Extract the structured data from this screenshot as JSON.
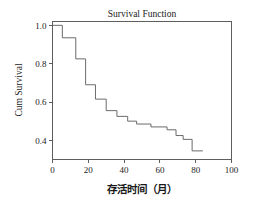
{
  "chart_data": {
    "type": "line",
    "subtype": "kaplan-meier-step",
    "title": "Survival Function",
    "xlabel": "存活时间（月）",
    "ylabel": "Cum Survival",
    "xlim": [
      0,
      100
    ],
    "ylim": [
      0.3,
      1.02
    ],
    "grid": false,
    "legend": null,
    "x_ticks": [
      0,
      20,
      40,
      60,
      80,
      100
    ],
    "x_tick_labels": [
      "0",
      "20",
      "40",
      "60",
      "80",
      "100"
    ],
    "y_ticks": [
      0.4,
      0.6,
      0.8,
      1.0
    ],
    "y_tick_labels": [
      "0.4",
      "0.6",
      "0.8",
      "1.0"
    ],
    "series": [
      {
        "name": "Cum Survival",
        "color": "#6b6b6b",
        "x": [
          0,
          5.5,
          5.5,
          13,
          13,
          18.5,
          18.5,
          24,
          24,
          30,
          30,
          36,
          36,
          42,
          42,
          47,
          47,
          55,
          55,
          64,
          64,
          69,
          69,
          73,
          73,
          78,
          78,
          84
        ],
        "y": [
          1.0,
          1.0,
          0.935,
          0.935,
          0.825,
          0.825,
          0.69,
          0.69,
          0.615,
          0.615,
          0.555,
          0.555,
          0.525,
          0.525,
          0.5,
          0.5,
          0.485,
          0.485,
          0.47,
          0.47,
          0.455,
          0.455,
          0.425,
          0.425,
          0.405,
          0.405,
          0.345,
          0.345
        ]
      }
    ],
    "steps": [
      {
        "time": 0,
        "survival": 1.0
      },
      {
        "time": 5.5,
        "survival": 0.935
      },
      {
        "time": 13,
        "survival": 0.825
      },
      {
        "time": 18.5,
        "survival": 0.69
      },
      {
        "time": 24,
        "survival": 0.615
      },
      {
        "time": 30,
        "survival": 0.555
      },
      {
        "time": 36,
        "survival": 0.525
      },
      {
        "time": 42,
        "survival": 0.5
      },
      {
        "time": 47,
        "survival": 0.485
      },
      {
        "time": 55,
        "survival": 0.47
      },
      {
        "time": 64,
        "survival": 0.455
      },
      {
        "time": 69,
        "survival": 0.425
      },
      {
        "time": 73,
        "survival": 0.405
      },
      {
        "time": 78,
        "survival": 0.345
      },
      {
        "time": 84,
        "survival": 0.345
      }
    ]
  }
}
